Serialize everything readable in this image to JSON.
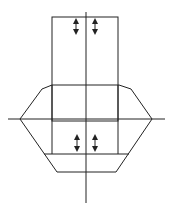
{
  "diagram": {
    "width": 173,
    "height": 213,
    "background": "#ffffff",
    "stroke_color": "#222222",
    "elements": [
      {
        "name": "top-rectangle",
        "type": "rect",
        "x": 52,
        "y": 17,
        "w": 66,
        "h": 104
      },
      {
        "name": "vertical-axis",
        "type": "line",
        "x1": 86,
        "y1": 12,
        "x2": 86,
        "y2": 203
      },
      {
        "name": "horizontal-axis",
        "type": "line",
        "x1": 8,
        "y1": 119,
        "x2": 165,
        "y2": 119
      },
      {
        "name": "octagon-outline",
        "type": "polygon",
        "points": "20,119 42,89 52,85 119,85 131,89 152,119 116,172 57,172"
      },
      {
        "name": "lower-horizontal-line",
        "type": "line",
        "x1": 44,
        "y1": 154,
        "x2": 129,
        "y2": 154
      },
      {
        "name": "rect-bottom-extension-left",
        "type": "line",
        "x1": 52,
        "y1": 85,
        "x2": 52,
        "y2": 154
      },
      {
        "name": "rect-bottom-extension-right",
        "type": "line",
        "x1": 118,
        "y1": 85,
        "x2": 118,
        "y2": 154
      }
    ],
    "arrows": [
      {
        "name": "top-left-double-arrow",
        "x": 76,
        "y1": 18,
        "y2": 35
      },
      {
        "name": "top-right-double-arrow",
        "x": 95,
        "y1": 18,
        "y2": 35
      },
      {
        "name": "bottom-left-double-arrow",
        "x": 77,
        "y1": 134,
        "y2": 152
      },
      {
        "name": "bottom-right-double-arrow",
        "x": 95,
        "y1": 134,
        "y2": 152
      }
    ]
  }
}
